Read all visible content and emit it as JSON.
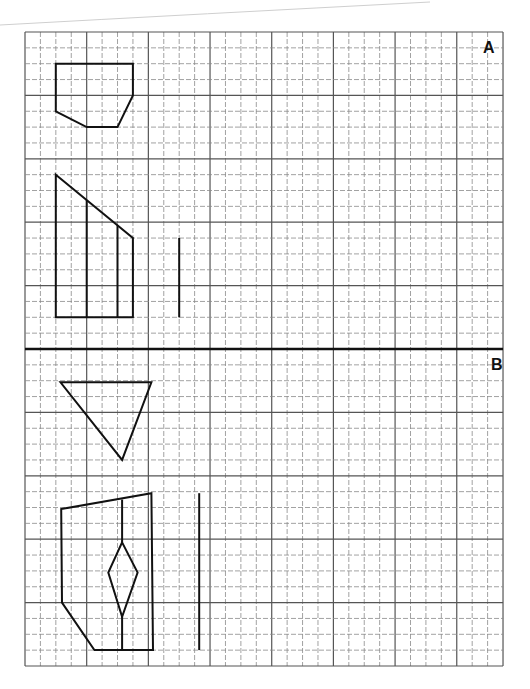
{
  "worksheet": {
    "grid": {
      "x0": 25,
      "y0": 32,
      "cols": 31,
      "rows": 40,
      "cell_w": 15.42,
      "cell_h": 15.85,
      "major_every": 4,
      "minor_color": "#8a8a8a",
      "major_color": "#555555",
      "divider_row": 20,
      "divider_color": "#111111"
    },
    "sections": [
      {
        "label": "A",
        "label_x": 483,
        "label_y": 40
      },
      {
        "label": "B",
        "label_x": 491,
        "label_y": 357
      }
    ],
    "shapes": {
      "stroke": "#111111",
      "a_pentagon": [
        [
          2,
          2
        ],
        [
          7,
          2
        ],
        [
          7,
          4
        ],
        [
          6,
          6
        ],
        [
          4,
          6
        ],
        [
          2,
          5
        ]
      ],
      "a_prism_outline": [
        [
          2,
          9
        ],
        [
          7,
          13
        ],
        [
          7,
          18
        ],
        [
          2,
          18
        ]
      ],
      "a_prism_lines": [
        [
          [
            4,
            10.6
          ],
          [
            4,
            18
          ]
        ],
        [
          [
            6,
            12.2
          ],
          [
            6,
            18
          ]
        ]
      ],
      "a_vertical_line": [
        [
          10,
          13
        ],
        [
          10,
          18
        ]
      ],
      "b_triangle": [
        [
          2.3,
          22.1
        ],
        [
          8.2,
          22.1
        ],
        [
          6.3,
          27
        ]
      ],
      "b_body_outline": [
        [
          2.35,
          30.1
        ],
        [
          8.2,
          29.1
        ],
        [
          8.3,
          39
        ],
        [
          4.5,
          39
        ],
        [
          2.4,
          36
        ]
      ],
      "b_center_line_top": [
        [
          6.3,
          29.5
        ],
        [
          6.3,
          32.2
        ]
      ],
      "b_diamond": [
        [
          6.3,
          32.2
        ],
        [
          7.3,
          34.1
        ],
        [
          6.3,
          36.9
        ],
        [
          5.4,
          34.1
        ]
      ],
      "b_center_line_bottom": [
        [
          6.3,
          36.9
        ],
        [
          6.3,
          39
        ]
      ],
      "b_vertical_line": [
        [
          11.3,
          29.1
        ],
        [
          11.3,
          39
        ]
      ]
    }
  }
}
